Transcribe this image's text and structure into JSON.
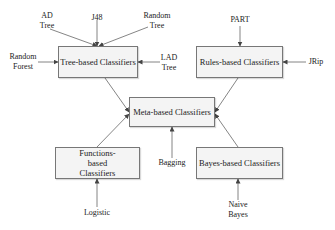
{
  "diagram": {
    "nodes": {
      "tree": {
        "label": "Tree-based Classifiers"
      },
      "rules": {
        "label": "Rules-based Classifiers"
      },
      "meta": {
        "label": "Meta-based Classifiers"
      },
      "functions": {
        "label": "Functions-based Classifiers"
      },
      "bayes": {
        "label": "Bayes-based Classifiers"
      }
    },
    "inputs": {
      "ad_tree": {
        "label": "AD Tree",
        "target": "tree"
      },
      "j48": {
        "label": "J48",
        "target": "tree"
      },
      "random_tree": {
        "label": "Random Tree",
        "target": "tree"
      },
      "random_forest": {
        "label": "Random Forest",
        "target": "tree"
      },
      "lad_tree": {
        "label": "LAD Tree",
        "target": "tree"
      },
      "part": {
        "label": "PART",
        "target": "rules"
      },
      "jrip": {
        "label": "JRip",
        "target": "rules"
      },
      "bagging": {
        "label": "Bagging",
        "target": "meta"
      },
      "logistic": {
        "label": "Logistic",
        "target": "functions"
      },
      "naive_bayes": {
        "label": "Naive Bayes",
        "target": "bayes"
      }
    },
    "edges": [
      {
        "from": "tree",
        "to": "meta"
      },
      {
        "from": "rules",
        "to": "meta"
      },
      {
        "from": "functions",
        "to": "meta"
      },
      {
        "from": "bayes",
        "to": "meta"
      }
    ]
  }
}
